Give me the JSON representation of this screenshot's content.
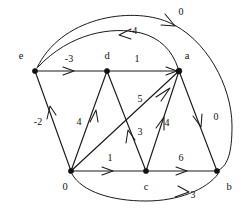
{
  "diagram": {
    "type": "directed-weighted-graph",
    "background_color": "#ffffff",
    "stroke_color": "#1a1a1a",
    "nodes": [
      {
        "id": "e",
        "label": "e",
        "x": 35,
        "y": 71,
        "label_x": 21,
        "label_y": 57
      },
      {
        "id": "d",
        "label": "d",
        "x": 107,
        "y": 71,
        "label_x": 107,
        "label_y": 57
      },
      {
        "id": "a",
        "label": "a",
        "x": 179,
        "y": 71,
        "label_x": 187,
        "label_y": 57
      },
      {
        "id": "s",
        "label": "0",
        "x": 71,
        "y": 171,
        "label_x": 65,
        "label_y": 187
      },
      {
        "id": "c",
        "label": "c",
        "x": 146,
        "y": 171,
        "label_x": 146,
        "label_y": 187
      },
      {
        "id": "b",
        "label": "b",
        "x": 217,
        "y": 171,
        "label_x": 229,
        "label_y": 187
      }
    ],
    "edges": [
      {
        "id": "e-b",
        "from": "e",
        "to": "b",
        "weight": "0",
        "label_x": 181,
        "label_y": 13,
        "shape": "curve-top-outer"
      },
      {
        "id": "a-e",
        "from": "a",
        "to": "e",
        "weight": "-4",
        "label_x": 133,
        "label_y": 32,
        "shape": "curve-top-inner"
      },
      {
        "id": "e-d",
        "from": "e",
        "to": "d",
        "weight": "-3",
        "label_x": 69,
        "label_y": 60,
        "shape": "straight"
      },
      {
        "id": "d-a",
        "from": "d",
        "to": "a",
        "weight": "1",
        "label_x": 137,
        "label_y": 60,
        "shape": "straight"
      },
      {
        "id": "s-e",
        "from": "s",
        "to": "e",
        "weight": "-2",
        "label_x": 38,
        "label_y": 123,
        "shape": "straight"
      },
      {
        "id": "s-d",
        "from": "s",
        "to": "d",
        "weight": "4",
        "label_x": 79,
        "label_y": 123,
        "shape": "straight"
      },
      {
        "id": "s-a",
        "from": "s",
        "to": "a",
        "weight": "5",
        "label_x": 140,
        "label_y": 100,
        "shape": "straight"
      },
      {
        "id": "c-d",
        "from": "c",
        "to": "d",
        "weight": "3",
        "label_x": 140,
        "label_y": 133,
        "shape": "straight"
      },
      {
        "id": "c-a",
        "from": "c",
        "to": "a",
        "weight": "4",
        "label_x": 167,
        "label_y": 124,
        "shape": "straight"
      },
      {
        "id": "s-c",
        "from": "s",
        "to": "c",
        "weight": "1",
        "label_x": 110,
        "label_y": 159,
        "shape": "straight"
      },
      {
        "id": "c-b",
        "from": "c",
        "to": "b",
        "weight": "6",
        "label_x": 181,
        "label_y": 159,
        "shape": "straight"
      },
      {
        "id": "a-b",
        "from": "a",
        "to": "b",
        "weight": "0",
        "label_x": 216,
        "label_y": 118,
        "shape": "straight"
      },
      {
        "id": "s-b",
        "from": "s",
        "to": "b",
        "weight": "3",
        "label_x": 193,
        "label_y": 196,
        "shape": "curve-bottom"
      }
    ]
  }
}
